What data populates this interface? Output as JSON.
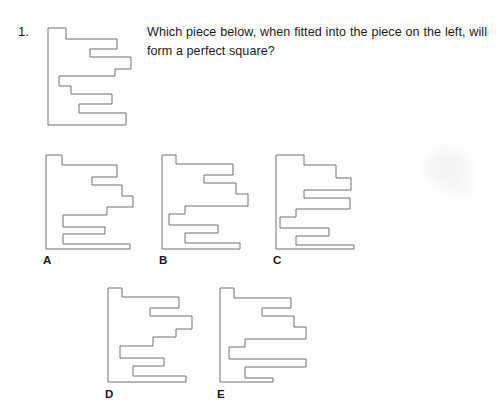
{
  "question": {
    "number": "1.",
    "text": "Which piece below, when fitted into the piece on the left, will form a perfect square?"
  },
  "colors": {
    "background": "#ffffff",
    "outline": "#6e6e72",
    "text": "#1a1a1a"
  },
  "prompt_figure": {
    "name": "main-piece",
    "description": "comb-shaped puzzle piece with solid left spine and stepped notches on the right",
    "viewbox": "0 0 88 104",
    "points": "2,2 20,2 20,13 71,13 71,23 44,23 44,31 85,31 85,43 69,43 69,50 13,50 13,60 25,60 25,68 66,68 66,78 33,78 33,87 80,87 80,99 2,99"
  },
  "options": [
    {
      "id": "A",
      "label": "A",
      "name": "option-a-piece",
      "viewbox": "0 0 95 98",
      "points": "2,2 18,2 18,12 73,12 73,24 48,24 48,32 78,32 78,43 89,43 89,54 63,54 63,62 19,62 19,74 61,74 61,81 19,81 19,91 86,91 86,96 2,96"
    },
    {
      "id": "B",
      "label": "B",
      "name": "option-b-piece",
      "viewbox": "0 0 95 98",
      "points": "2,2 16,2 16,11 73,11 73,22 44,22 44,30 76,30 76,41 88,41 88,53 25,53 25,61 9,61 9,72 58,72 58,80 25,80 25,90 80,90 80,96 2,96"
    },
    {
      "id": "C",
      "label": "C",
      "name": "option-c-piece",
      "viewbox": "0 0 95 98",
      "points": "2,2 30,2 30,12 62,12 62,25 77,25 77,37 30,37 30,45 76,45 76,56 22,56 22,64 6,64 6,75 55,75 55,83 22,83 22,92 80,92 80,96 2,96"
    },
    {
      "id": "D",
      "label": "D",
      "name": "option-d-piece",
      "viewbox": "0 0 95 98",
      "points": "2,2 16,2 16,11 73,11 73,22 44,22 44,30 86,30 86,43 70,43 70,51 47,51 47,60 14,60 14,72 58,72 58,80 27,80 27,90 80,90 80,96 2,96"
    },
    {
      "id": "E",
      "label": "E",
      "name": "option-e-piece",
      "viewbox": "0 0 95 98",
      "points": "2,2 16,2 16,12 73,12 73,22 44,22 44,30 76,30 76,41 88,41 88,53 27,53 27,61 11,61 11,73 88,73 88,81 27,81 27,92 55,92 55,96 2,96"
    }
  ]
}
